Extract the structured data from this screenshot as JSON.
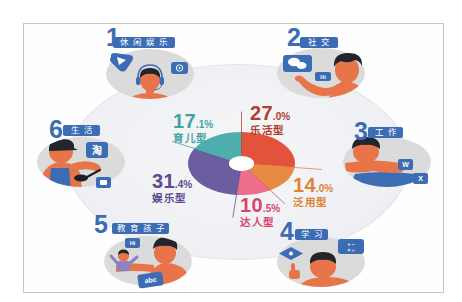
{
  "chart_data": {
    "type": "pie",
    "variant": "donut",
    "title": "",
    "xlabel": "",
    "ylabel": "",
    "categories": [
      "乐活型",
      "泛用型",
      "达人型",
      "娱乐型",
      "育儿型"
    ],
    "values": [
      27.0,
      14.0,
      10.5,
      31.4,
      17.1
    ],
    "value_labels": [
      "27.0%",
      "14.0%",
      "10.5%",
      "31.4%",
      "17.1%"
    ],
    "unit": "%",
    "colors": [
      "#e3533c",
      "#e98a43",
      "#eb6f8b",
      "#6b5d9f",
      "#4daeac"
    ],
    "start_angle_deg": 0,
    "direction": "clockwise",
    "legend": "none",
    "labels_position": "outside with leader lines",
    "grid": false
  },
  "donut_labels": [
    {
      "int": "27",
      "dec": ".0%",
      "name": "乐活型",
      "color": "#b03e2c"
    },
    {
      "int": "14",
      "dec": ".0%",
      "name": "泛用型",
      "color": "#df8238"
    },
    {
      "int": "10",
      "dec": ".5%",
      "name": "达人型",
      "color": "#d8456a"
    },
    {
      "int": "31",
      "dec": ".4%",
      "name": "娱乐型",
      "color": "#5a4c8e"
    },
    {
      "int": "17",
      "dec": ".1%",
      "name": "育儿型",
      "color": "#3fa3a3"
    }
  ],
  "scenarios": [
    {
      "number": "1",
      "label": "休闲娱乐",
      "icons": [
        "play-icon",
        "music-icon"
      ],
      "icon_text": {}
    },
    {
      "number": "2",
      "label": "社交",
      "icons": [
        "wechat-icon",
        "hi-chat-icon"
      ],
      "icon_text": {
        "hi": "Hi"
      }
    },
    {
      "number": "3",
      "label": "工作",
      "icons": [
        "word-icon",
        "excel-icon"
      ],
      "icon_text": {
        "word": "W",
        "excel": "X"
      }
    },
    {
      "number": "4",
      "label": "学习",
      "icons": [
        "diamond-icon",
        "calculator-icon"
      ],
      "icon_text": {
        "calc_row1": "+ −",
        "calc_row2": "× ÷"
      }
    },
    {
      "number": "5",
      "label": "教育孩子",
      "icons": [
        "hi-chat-icon",
        "abc-card-icon"
      ],
      "icon_text": {
        "hi": "Hi",
        "abc": "abc"
      }
    },
    {
      "number": "6",
      "label": "生活",
      "icons": [
        "taobao-icon",
        "card-icon"
      ],
      "icon_text": {
        "taobao": "淘"
      }
    }
  ],
  "theme": {
    "accent_blue": "#3c6cb4",
    "skin": "#e8744a",
    "hair": "#23252d",
    "circle_gray": "#dbdbdb",
    "ring_fill": "#eff0f3",
    "frame_border": "#c6c6c6",
    "child_shirt": "#8c82c2",
    "pan": "#1e1f25"
  }
}
